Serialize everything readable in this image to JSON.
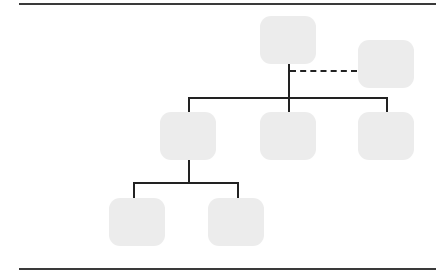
{
  "diagram": {
    "type": "org-chart",
    "colors": {
      "node_fill": "#ececec",
      "connector": "#222222",
      "rule": "#3a3a3a"
    },
    "nodes": [
      {
        "id": "root",
        "label": ""
      },
      {
        "id": "assistant",
        "label": "",
        "relation": "dotted-line to root"
      },
      {
        "id": "child-1",
        "label": "",
        "parent": "root"
      },
      {
        "id": "child-2",
        "label": "",
        "parent": "root"
      },
      {
        "id": "child-3",
        "label": "",
        "parent": "root"
      },
      {
        "id": "grandchild-1",
        "label": "",
        "parent": "child-1"
      },
      {
        "id": "grandchild-2",
        "label": "",
        "parent": "child-1"
      }
    ]
  }
}
